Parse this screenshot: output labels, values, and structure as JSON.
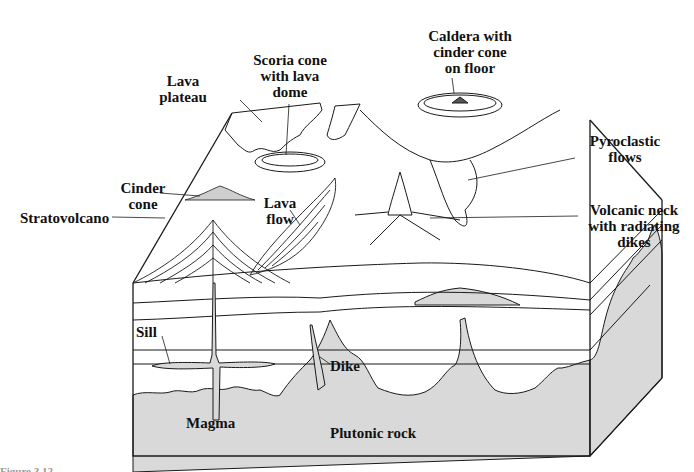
{
  "figure": {
    "caption_partial": "Figure 3.12",
    "colors": {
      "line": "#1a1a1a",
      "plutonic_fill": "#d8d8d8",
      "background": "#ffffff"
    }
  },
  "labels": {
    "caldera": [
      "Caldera with",
      "cinder cone",
      "on floor"
    ],
    "scoria": [
      "Scoria cone",
      "with lava",
      "dome"
    ],
    "lava_plateau": [
      "Lava",
      "plateau"
    ],
    "pyroclastic": [
      "Pyroclastic",
      "flows"
    ],
    "cinder_cone": [
      "Cinder",
      "cone"
    ],
    "lava_flow": [
      "Lava",
      "flow"
    ],
    "volcanic_neck": [
      "Volcanic neck",
      "with radiating",
      "dikes"
    ],
    "stratovolcano": "Stratovolcano",
    "sill": "Sill",
    "dike": "Dike",
    "magma": "Magma",
    "plutonic_rock": "Plutonic rock"
  }
}
